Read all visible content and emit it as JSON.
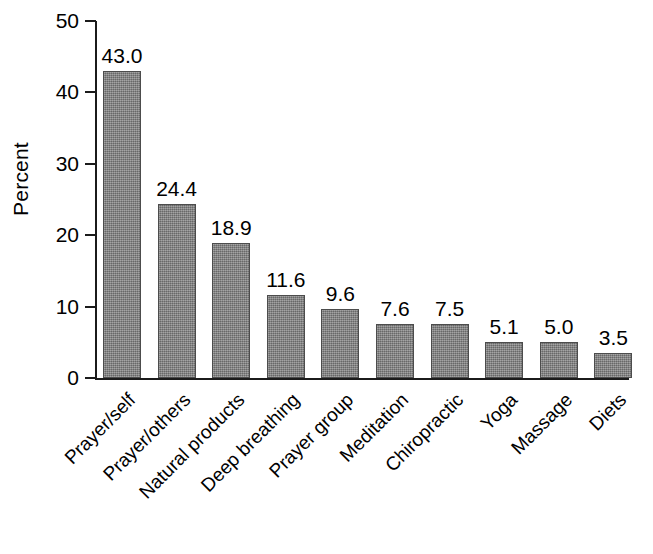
{
  "chart_data": {
    "type": "bar",
    "title": "",
    "subtitle": "",
    "xlabel": "",
    "ylabel": "Percent",
    "ylim": [
      0,
      50
    ],
    "ytick_labels": [
      "50",
      "40",
      "30",
      "20",
      "10",
      "0"
    ],
    "ytick_values": [
      50,
      40,
      30,
      20,
      10,
      0
    ],
    "grid": false,
    "legend": null,
    "value_label_format": "one-decimal",
    "category_label_rotation_deg": -45,
    "bar_color": "#808080",
    "bar_edge_color": "#4c4c4c",
    "axis_color": "#1b1b1b",
    "background_color": "#ffffff",
    "categories": [
      "Prayer/self",
      "Prayer/others",
      "Natural products",
      "Deep breathing",
      "Prayer group",
      "Meditation",
      "Chiropractic",
      "Yoga",
      "Massage",
      "Diets"
    ],
    "values": [
      43.0,
      24.4,
      18.9,
      11.6,
      9.6,
      7.6,
      7.5,
      5.1,
      5.0,
      3.5
    ],
    "value_labels": [
      "43.0",
      "24.4",
      "18.9",
      "11.6",
      "9.6",
      "7.6",
      "7.5",
      "5.1",
      "5.0",
      "3.5"
    ]
  }
}
